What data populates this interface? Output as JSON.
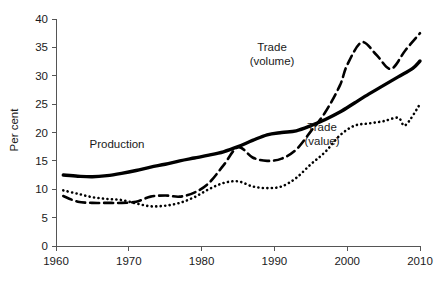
{
  "chart_data": {
    "type": "line",
    "title": "",
    "xlabel": "",
    "ylabel": "Per cent",
    "xlim": [
      1960,
      2010
    ],
    "ylim": [
      0,
      40
    ],
    "xticks": [
      1960,
      1970,
      1980,
      1990,
      2000,
      2010
    ],
    "yticks": [
      0,
      5,
      10,
      15,
      20,
      25,
      30,
      35,
      40
    ],
    "grid": false,
    "legend_position": "inline-annotations",
    "series": [
      {
        "name": "Production",
        "style": "solid",
        "color": "#000000",
        "label_text": "Production",
        "x": [
          1961,
          1963,
          1965,
          1967,
          1969,
          1971,
          1973,
          1975,
          1977,
          1979,
          1981,
          1983,
          1985,
          1987,
          1989,
          1991,
          1993,
          1995,
          1997,
          1999,
          2001,
          2003,
          2005,
          2007,
          2009,
          2010
        ],
        "values": [
          12.5,
          12.3,
          12.2,
          12.4,
          12.8,
          13.3,
          13.9,
          14.4,
          15.0,
          15.5,
          16.0,
          16.6,
          17.5,
          18.6,
          19.6,
          20.0,
          20.3,
          21.2,
          22.3,
          23.6,
          25.2,
          26.8,
          28.3,
          29.8,
          31.3,
          32.6
        ]
      },
      {
        "name": "Trade (volume)",
        "style": "dashed",
        "color": "#000000",
        "label_text": "Trade\n(volume)",
        "label_line1": "Trade",
        "label_line2": "(volume)",
        "x": [
          1961,
          1963,
          1965,
          1967,
          1969,
          1971,
          1973,
          1975,
          1977,
          1979,
          1981,
          1983,
          1985,
          1987,
          1989,
          1991,
          1993,
          1995,
          1997,
          1999,
          2000,
          2002,
          2004,
          2006,
          2008,
          2010
        ],
        "values": [
          8.8,
          7.8,
          7.6,
          7.6,
          7.6,
          7.8,
          8.7,
          8.9,
          8.7,
          9.4,
          11.1,
          14.2,
          17.4,
          15.6,
          15.0,
          15.4,
          17.0,
          20.2,
          23.6,
          28.3,
          31.9,
          35.9,
          33.7,
          31.2,
          34.5,
          37.5
        ]
      },
      {
        "name": "Trade (value)",
        "style": "dotted",
        "color": "#000000",
        "label_text": "Trade\n(value)",
        "label_line1": "Trade",
        "label_line2": "(value)",
        "x": [
          1961,
          1963,
          1965,
          1967,
          1969,
          1971,
          1973,
          1975,
          1977,
          1979,
          1981,
          1983,
          1985,
          1987,
          1989,
          1991,
          1993,
          1995,
          1997,
          1999,
          2001,
          2003,
          2005,
          2007,
          2008,
          2010
        ],
        "values": [
          9.8,
          9.2,
          8.6,
          8.3,
          8.1,
          7.5,
          7.0,
          7.1,
          7.6,
          8.6,
          10.0,
          11.1,
          11.4,
          10.5,
          10.2,
          10.5,
          12.0,
          14.4,
          16.6,
          19.5,
          21.2,
          21.6,
          22.0,
          22.6,
          21.3,
          25.0
        ]
      }
    ],
    "annotations": [
      {
        "name": "production-label",
        "text": "Production",
        "x_px": 117,
        "y_px": 148
      },
      {
        "name": "trade-volume-label",
        "line1": "Trade",
        "line2": "(volume)",
        "x_px": 272,
        "y_px": 51
      },
      {
        "name": "trade-value-label",
        "line1": "Trade",
        "line2": "(value)",
        "x_px": 322,
        "y_px": 131
      }
    ]
  },
  "axes": {
    "y_title": "Per cent",
    "y_tick_labels": [
      "0",
      "5",
      "10",
      "15",
      "20",
      "25",
      "30",
      "35",
      "40"
    ],
    "x_tick_labels": [
      "1960",
      "1970",
      "1980",
      "1990",
      "2000",
      "2010"
    ]
  },
  "colors": {
    "line": "#000000",
    "axis": "#555555",
    "text": "#1a1a1a",
    "background": "#ffffff"
  }
}
